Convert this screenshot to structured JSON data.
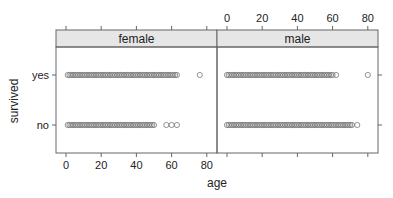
{
  "chart_data": {
    "type": "scatter",
    "title": "",
    "xlabel": "age",
    "ylabel": "survived",
    "xlim": [
      -3,
      85
    ],
    "x_ticks": [
      0,
      20,
      40,
      60,
      80
    ],
    "y_categories": [
      "no",
      "yes"
    ],
    "panels": [
      {
        "name": "female",
        "series": [
          {
            "name": "yes",
            "x_range_dense": [
              1,
              63
            ],
            "extra_points": [
              76
            ]
          },
          {
            "name": "no",
            "x_range_dense": [
              1,
              50
            ],
            "extra_points": [
              57,
              60,
              63
            ]
          }
        ]
      },
      {
        "name": "male",
        "series": [
          {
            "name": "yes",
            "x_range_dense": [
              0,
              60
            ],
            "extra_points": [
              62,
              80
            ]
          },
          {
            "name": "no",
            "x_range_dense": [
              0,
              71
            ],
            "extra_points": [
              74
            ]
          }
        ]
      }
    ],
    "legend": null,
    "grid": false
  },
  "labels": {
    "xlabel": "age",
    "ylabel": "survived",
    "y_yes": "yes",
    "y_no": "no",
    "panel_left": "female",
    "panel_right": "male"
  }
}
